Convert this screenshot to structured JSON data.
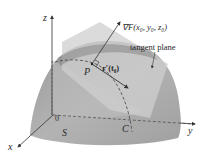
{
  "diagram": {
    "labels": {
      "z_axis": "z",
      "x_axis": "x",
      "y_axis": "y",
      "origin": "0",
      "surface": "S",
      "curve": "C",
      "point": "P",
      "gradient": "∇F(x₀, y₀, z₀)",
      "tangent_vector": "r′(t₀)",
      "tangent_plane": "tangent plane"
    },
    "colors": {
      "surface": "#a9a9a9",
      "surface_dark": "#8f8f8f",
      "plane": "#c9c9c9",
      "axis": "#333333",
      "text": "#2a2a2a"
    }
  }
}
